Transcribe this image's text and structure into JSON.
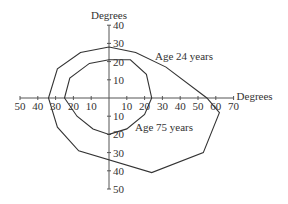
{
  "chart_data": {
    "type": "line",
    "subtype": "polar-like visual field plot",
    "title": "",
    "xlabel": "Degrees",
    "ylabel": "Degrees",
    "x_ticks": [
      50,
      40,
      30,
      20,
      10,
      10,
      20,
      30,
      40,
      50,
      60,
      70
    ],
    "x_tick_values": [
      -50,
      -40,
      -30,
      -20,
      -10,
      10,
      20,
      30,
      40,
      50,
      60,
      70
    ],
    "y_ticks": [
      40,
      30,
      20,
      10,
      10,
      20,
      30,
      40,
      50
    ],
    "y_tick_values": [
      40,
      30,
      20,
      10,
      -10,
      -20,
      -30,
      -40,
      -50
    ],
    "xlim": [
      -50,
      70
    ],
    "ylim": [
      -50,
      40
    ],
    "grid": false,
    "series": [
      {
        "name": "Age 24 years",
        "points": [
          [
            0,
            28
          ],
          [
            15,
            25
          ],
          [
            32,
            17
          ],
          [
            55,
            0
          ],
          [
            62,
            -8
          ],
          [
            53,
            -30
          ],
          [
            24,
            -41
          ],
          [
            -17,
            -29
          ],
          [
            -29,
            -16
          ],
          [
            -34,
            0
          ],
          [
            -29,
            16
          ],
          [
            -16,
            25
          ],
          [
            0,
            28
          ]
        ]
      },
      {
        "name": "Age 75 years",
        "points": [
          [
            0,
            21
          ],
          [
            12,
            21
          ],
          [
            21,
            13
          ],
          [
            24,
            0
          ],
          [
            20,
            -9
          ],
          [
            10,
            -17
          ],
          [
            0,
            -20
          ],
          [
            -9,
            -17
          ],
          [
            -18,
            -10
          ],
          [
            -25,
            0
          ],
          [
            -22,
            11
          ],
          [
            -11,
            19
          ],
          [
            0,
            21
          ]
        ]
      }
    ],
    "annotations": [
      "Age 24 years",
      "Age 75 years"
    ]
  }
}
